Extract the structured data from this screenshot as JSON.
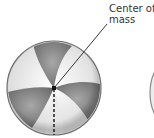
{
  "diagram": {
    "label": {
      "line1": "Center of",
      "line2": "mass"
    },
    "colors": {
      "panel_dark": "#8a8a8a",
      "panel_light": "#f2f2f2",
      "outline": "#6f6f6f",
      "line": "#222222"
    }
  }
}
